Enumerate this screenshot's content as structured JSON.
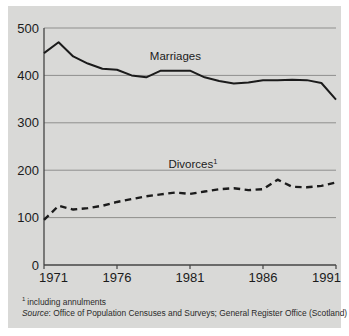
{
  "figure": {
    "background_color": "#d9d9d7",
    "page_color": "#ffffff",
    "line_color": "#1b1b1b",
    "grid_color": "#8f8f8d"
  },
  "notes": {
    "footnote_marker": "1",
    "footnote_text": "including annulments",
    "source_label": "Source",
    "source_separator": ": ",
    "source_text": "Office of Population Censuses and Surveys; General Register Office (Scotland)"
  },
  "chart_data": {
    "type": "line",
    "title": "",
    "subtitle": "",
    "xlabel": "",
    "ylabel": "",
    "xlim": [
      1971,
      1991
    ],
    "ylim": [
      0,
      500
    ],
    "ytick_labels": [
      "0",
      "100",
      "200",
      "300",
      "400",
      "500"
    ],
    "ytick_values": [
      0,
      100,
      200,
      300,
      400,
      500
    ],
    "xtick_labels": [
      "1971",
      "1976",
      "1981",
      "1986",
      "1991"
    ],
    "xtick_values": [
      1971,
      1976,
      1981,
      1986,
      1991
    ],
    "grid": "horizontal",
    "legend_position": "inline-annotation",
    "annotations": [
      {
        "name": "marriages-label",
        "text": "Marriages",
        "superscript": "",
        "x": 1980.0,
        "y": 432
      },
      {
        "name": "divorces-label",
        "text": "Divorces",
        "superscript": "1",
        "x": 1981.2,
        "y": 205
      }
    ],
    "x": [
      1971,
      1972,
      1973,
      1974,
      1975,
      1976,
      1977,
      1978,
      1979,
      1980,
      1981,
      1982,
      1983,
      1984,
      1985,
      1986,
      1987,
      1988,
      1989,
      1990,
      1991
    ],
    "series": [
      {
        "name": "Marriages",
        "style": "solid",
        "values": [
          447,
          470,
          440,
          425,
          414,
          412,
          400,
          396,
          410,
          410,
          410,
          396,
          388,
          383,
          385,
          390,
          390,
          391,
          390,
          384,
          349
        ],
        "units": "thousands"
      },
      {
        "name": "Divorces",
        "style": "dashed",
        "values": [
          95,
          125,
          117,
          120,
          125,
          133,
          139,
          145,
          149,
          153,
          150,
          155,
          160,
          162,
          158,
          160,
          180,
          165,
          164,
          167,
          174
        ],
        "units": "thousands"
      }
    ]
  }
}
